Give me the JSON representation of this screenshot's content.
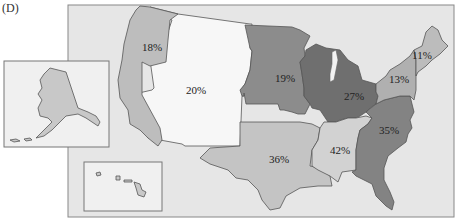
{
  "panel_label": "(D)",
  "map": {
    "title": "",
    "regions": [
      {
        "id": "pacific",
        "name": "Pacific",
        "label": "18%",
        "value": 18,
        "fill": "#bdbdbd"
      },
      {
        "id": "mountain",
        "name": "Mountain",
        "label": "20%",
        "value": 20,
        "fill": "#f7f7f7"
      },
      {
        "id": "west-north-central",
        "name": "West North Central",
        "label": "19%",
        "value": 19,
        "fill": "#8c8c8c"
      },
      {
        "id": "east-north-central",
        "name": "East North Central",
        "label": "27%",
        "value": 27,
        "fill": "#6f6f6f"
      },
      {
        "id": "middle-atlantic",
        "name": "Middle Atlantic",
        "label": "13%",
        "value": 13,
        "fill": "#b0b0b0"
      },
      {
        "id": "new-england",
        "name": "New England",
        "label": "11%",
        "value": 11,
        "fill": "#bcbcbc"
      },
      {
        "id": "south-atlantic",
        "name": "South Atlantic",
        "label": "35%",
        "value": 35,
        "fill": "#838383"
      },
      {
        "id": "east-south-central",
        "name": "East South Central",
        "label": "42%",
        "value": 42,
        "fill": "#d2d2d2"
      },
      {
        "id": "west-south-central",
        "name": "West South Central",
        "label": "36%",
        "value": 36,
        "fill": "#c4c4c4"
      }
    ],
    "insets": [
      {
        "id": "alaska",
        "name": "Alaska",
        "fill": "#c8c8c8"
      },
      {
        "id": "hawaii",
        "name": "Hawaii",
        "fill": "#c8c8c8"
      }
    ],
    "background_fill": "#e6e6e6"
  }
}
